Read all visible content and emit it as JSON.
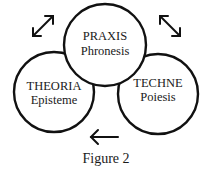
{
  "figure": {
    "caption": "Figure 2",
    "colors": {
      "stroke": "#111111",
      "text": "#1a1a1a",
      "background": "#ffffff"
    },
    "nodes": [
      {
        "id": "praxis",
        "title": "PRAXIS",
        "subtitle": "Phronesis",
        "position": "top-center"
      },
      {
        "id": "theoria",
        "title": "THEORIA",
        "subtitle": "Episteme",
        "position": "bottom-left"
      },
      {
        "id": "techne",
        "title": "TECHNE",
        "subtitle": "Poiesis",
        "position": "bottom-right"
      }
    ],
    "arrows": [
      {
        "id": "theoria-praxis",
        "type": "double-headed",
        "direction": "diagonal-up-right",
        "position": "top-left"
      },
      {
        "id": "praxis-techne",
        "type": "double-headed",
        "direction": "diagonal-down-right",
        "position": "top-right"
      },
      {
        "id": "techne-to-theoria",
        "type": "single-headed",
        "direction": "left",
        "position": "bottom-center"
      }
    ]
  }
}
